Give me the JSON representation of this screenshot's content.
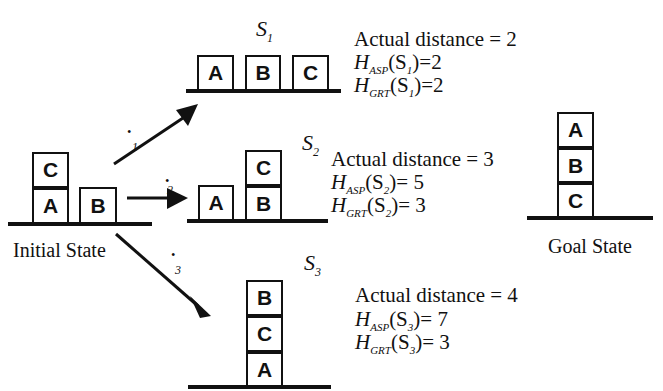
{
  "initial_state": {
    "label": "Initial State",
    "blocks": [
      "C",
      "A",
      "B"
    ]
  },
  "goal_state": {
    "label": "Goal State",
    "blocks": [
      "A",
      "B",
      "C"
    ]
  },
  "operators": [
    {
      "symbol": "•",
      "index": "1"
    },
    {
      "symbol": "•",
      "index": "2"
    },
    {
      "symbol": "•",
      "index": "3"
    }
  ],
  "states": [
    {
      "name": "S",
      "sub": "1",
      "blocks": [
        "A",
        "B",
        "C"
      ],
      "actual": "Actual distance = 2",
      "h_asp": {
        "H": "H",
        "sub": "ASP",
        "arg": "(S",
        "argsub": "1",
        "val": ")=2"
      },
      "h_grt": {
        "H": "H",
        "sub": "GRT",
        "arg": "(S",
        "argsub": "1",
        "val": ")=2"
      }
    },
    {
      "name": "S",
      "sub": "2",
      "blocks": [
        "A",
        "C",
        "B"
      ],
      "actual": "Actual distance = 3",
      "h_asp": {
        "H": "H",
        "sub": "ASP",
        "arg": "(S",
        "argsub": "2",
        "val": ")= 5"
      },
      "h_grt": {
        "H": "H",
        "sub": "GRT",
        "arg": "(S",
        "argsub": "2",
        "val": ")= 3"
      }
    },
    {
      "name": "S",
      "sub": "3",
      "blocks": [
        "B",
        "C",
        "A"
      ],
      "actual": "Actual distance = 4",
      "h_asp": {
        "H": "H",
        "sub": "ASP",
        "arg": "(S",
        "argsub": "3",
        "val": ")= 7"
      },
      "h_grt": {
        "H": "H",
        "sub": "GRT",
        "arg": "(S",
        "argsub": "3",
        "val": ")= 3"
      }
    }
  ]
}
